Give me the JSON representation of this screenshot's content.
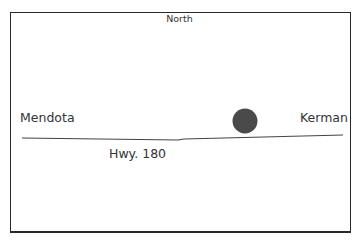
{
  "map": {
    "compass_label": "North",
    "places": [
      {
        "name": "Mendota",
        "side": "west"
      },
      {
        "name": "Kerman",
        "side": "east"
      }
    ],
    "road": {
      "label": "Hwy. 180"
    },
    "marker": {
      "type": "filled-circle",
      "color": "#4a4a4a"
    },
    "colors": {
      "border": "#2a2a2a",
      "road": "#444444",
      "text": "#333333",
      "background": "#ffffff"
    }
  }
}
